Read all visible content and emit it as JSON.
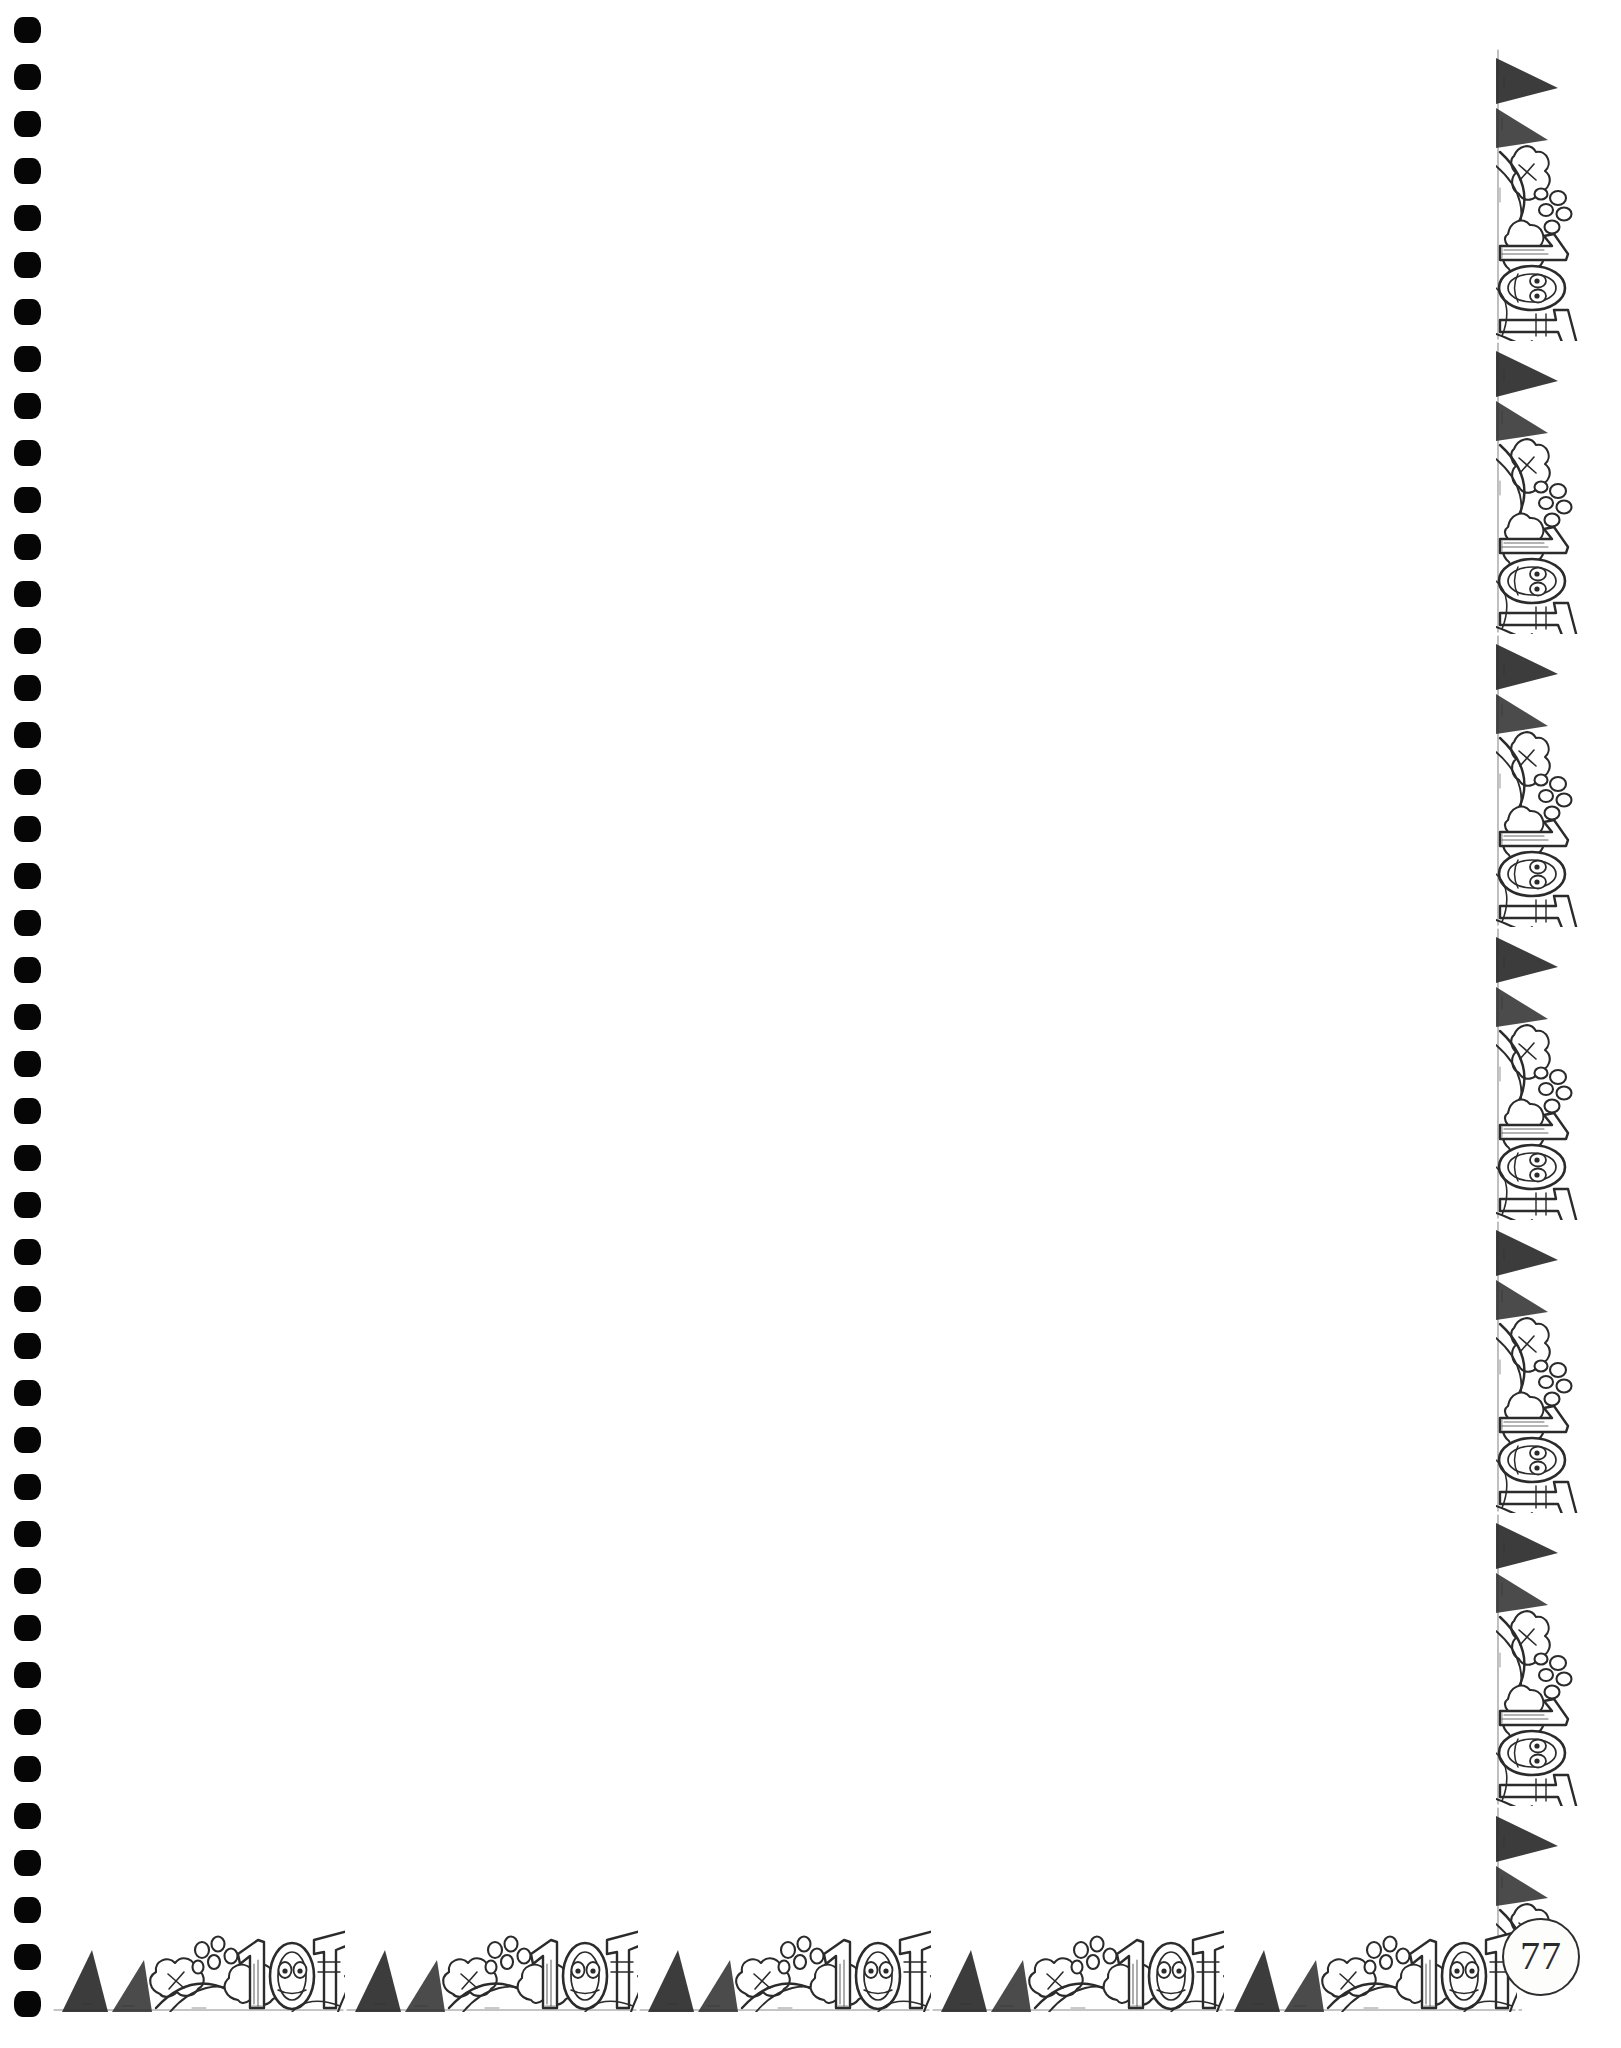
{
  "page": {
    "kind": "scanned-workbook-page",
    "width": 1621,
    "height": 2048,
    "background_color": "#ffffff",
    "ink_color": "#2b2b2b",
    "hole_color": "#060606",
    "content_text": ""
  },
  "binding": {
    "label": "spiral-binding-holes",
    "hole_count": 43,
    "hole_left": 14,
    "hole_width": 27,
    "hole_height": 26,
    "first_hole_top": 17,
    "hole_spacing": 47
  },
  "border": {
    "label": "decorative-cartoon-border",
    "motif_text": "10",
    "motif_description": "repeating hand-drawn cartoon strip with 10 numerals, round faces with eyes, cloud-like foliage and dark triangular wedges",
    "tile_size": 293,
    "strip_thickness": 92,
    "right": {
      "label": "right-decorative-border",
      "tile_count": 7,
      "top": 48,
      "right": 33,
      "height": 1912
    },
    "bottom": {
      "label": "bottom-decorative-border",
      "tile_count": 6,
      "left": 52,
      "bottom": 36,
      "width": 1470
    }
  },
  "page_number": {
    "label": "page-number-medallion",
    "value": "77"
  }
}
